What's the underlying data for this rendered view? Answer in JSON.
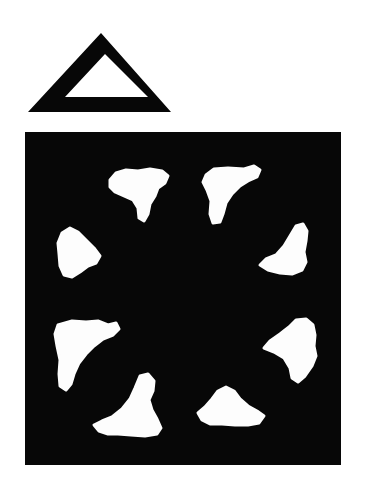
{
  "figure": {
    "title": "Outlined triangle above a black square containing eight white blob shapes",
    "caption": "",
    "background_color": "#ffffff",
    "ink_color": "#050505",
    "blob_color": "#ffffff",
    "width": 366,
    "height": 492
  },
  "triangle": {
    "name": "hollow-triangle",
    "description": "Thick-stroked outline triangle, apex up, hollow white interior",
    "fill_color": "#070707",
    "interior_color": "#ffffff",
    "outer": {
      "apex_x": 101,
      "apex_y": 33,
      "left_x": 28,
      "left_y": 112,
      "right_x": 171,
      "right_y": 112
    },
    "inner": {
      "apex_x": 105,
      "apex_y": 54,
      "left_x": 65,
      "left_y": 97,
      "right_x": 148,
      "right_y": 97
    }
  },
  "square": {
    "name": "black-square-panel",
    "fill_color": "#070707",
    "x": 25,
    "y": 132,
    "width": 316,
    "height": 333
  },
  "blobs": [
    {
      "id": "blob-top-left",
      "label": "top-left inducer",
      "color": "#fdfdfd",
      "center_x": 140,
      "center_y": 192,
      "path": "M110,180 L116,173 L126,170 L138,171 L150,169 L162,171 L168,176 L165,183 L158,188 L155,196 L150,204 L148,214 L144,221 L139,218 L138,208 L133,200 L124,196 L115,192 L110,187 Z"
    },
    {
      "id": "blob-top-right",
      "label": "top-right inducer",
      "color": "#fdfdfd",
      "center_x": 232,
      "center_y": 196,
      "path": "M206,175 L214,169 L228,168 L244,169 L254,166 L260,170 L257,177 L248,181 L240,186 L232,194 L226,203 L223,214 L220,222 L213,223 L210,214 L211,201 L207,190 L203,182 Z"
    },
    {
      "id": "blob-left-upper",
      "label": "left-upper inducer",
      "color": "#fdfdfd",
      "center_x": 78,
      "center_y": 253,
      "path": "M62,233 L70,228 L78,232 L86,240 L94,248 L100,256 L96,263 L88,266 L80,272 L72,277 L64,275 L60,266 L59,254 L58,243 Z"
    },
    {
      "id": "blob-right-upper",
      "label": "right-upper inducer",
      "color": "#fdfdfd",
      "center_x": 290,
      "center_y": 258,
      "path": "M296,226 L303,224 L307,231 L306,241 L304,252 L306,262 L302,270 L292,274 L280,273 L268,270 L260,265 L266,259 L276,255 L284,246 L290,236 Z"
    },
    {
      "id": "blob-left-lower",
      "label": "left-lower inducer",
      "color": "#fdfdfd",
      "center_x": 83,
      "center_y": 350,
      "path": "M58,325 L72,321 L86,322 L98,321 L108,325 L116,323 L119,329 L113,335 L103,339 L94,346 L86,354 L79,363 L74,374 L71,384 L66,390 L60,386 L59,374 L60,360 L57,346 L55,334 Z"
    },
    {
      "id": "blob-right-lower",
      "label": "right-lower inducer",
      "color": "#fdfdfd",
      "center_x": 300,
      "center_y": 349,
      "path": "M296,320 L306,319 L313,325 L315,335 L314,346 L316,356 L312,366 L305,376 L298,382 L292,378 L290,368 L284,358 L274,352 L264,348 L270,341 L280,334 L289,327 Z"
    },
    {
      "id": "blob-bottom-left",
      "label": "bottom-left inducer",
      "color": "#fdfdfd",
      "center_x": 137,
      "center_y": 412,
      "path": "M140,376 L148,374 L154,381 L153,391 L149,400 L152,410 L157,419 L161,428 L157,434 L145,436 L131,435 L118,434 L108,434 L99,431 L94,425 L102,421 L112,417 L122,409 L130,399 L135,388 Z"
    },
    {
      "id": "blob-bottom-right",
      "label": "bottom-right inducer",
      "color": "#fdfdfd",
      "center_x": 227,
      "center_y": 412,
      "path": "M218,391 L226,387 L234,391 L240,399 L248,406 L257,411 L264,416 L259,423 L248,425 L235,425 L222,424 L210,424 L202,420 L198,413 L205,407 L212,399 Z"
    }
  ],
  "meta": {
    "shape_count": 8,
    "arrangement": "ring / radial, two per side",
    "panel_count": 2
  }
}
